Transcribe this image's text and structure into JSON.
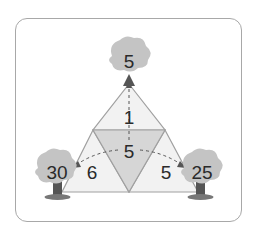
{
  "diagram": {
    "trees": {
      "top": {
        "value": "5"
      },
      "left": {
        "value": "30"
      },
      "right": {
        "value": "25"
      }
    },
    "regions": {
      "top": {
        "value": "1"
      },
      "center": {
        "value": "5"
      },
      "left": {
        "value": "6"
      },
      "right": {
        "value": "5"
      }
    },
    "colors": {
      "outer_fill": "#f2f2f2",
      "center_fill": "#d6d6d6",
      "edge": "#a0a0a0",
      "tree_crown": "#c4c4c4",
      "tree_trunk": "#555555",
      "arrow": "#555555"
    }
  }
}
